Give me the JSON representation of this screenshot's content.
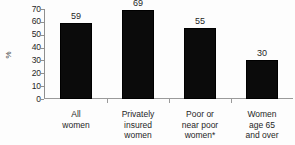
{
  "chart_data": {
    "type": "bar",
    "title": "",
    "xlabel": "",
    "ylabel": "%",
    "ylim": [
      0,
      70
    ],
    "ytick_step": 10,
    "grid": false,
    "legend": "none",
    "bar_color": "#0b0b0b",
    "axis_color": "#8f8f8f",
    "categories": [
      "All\nwomen",
      "Privately\ninsured\nwomen",
      "Poor or\nnear poor\nwomen*",
      "Women\nage 65\nand over"
    ],
    "values": [
      59,
      69,
      55,
      30
    ],
    "value_labels": [
      "59",
      "69",
      "55",
      "30"
    ],
    "ytick_labels": [
      "70",
      "60",
      "50",
      "40",
      "30",
      "20",
      "10",
      "0"
    ],
    "ytick_values": [
      70,
      60,
      50,
      40,
      30,
      20,
      10,
      0
    ]
  }
}
